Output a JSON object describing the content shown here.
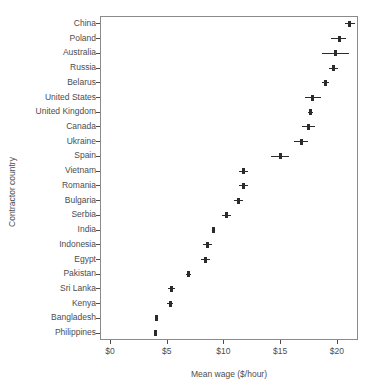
{
  "chart_data": {
    "type": "scatter",
    "title": "",
    "xlabel": "Mean wage ($/hour)",
    "ylabel": "Contractor country",
    "xlim": [
      -1.0,
      22.8
    ],
    "xticks": [
      0,
      5,
      10,
      15,
      20
    ],
    "xticklabels": [
      "$0",
      "$5",
      "$10",
      "$15",
      "$20"
    ],
    "grid": false,
    "legend": null,
    "orientation": "horizontal",
    "categories": [
      "China",
      "Poland",
      "Australia",
      "Russia",
      "Belarus",
      "United States",
      "United Kingdom",
      "Canada",
      "Ukraine",
      "Spain",
      "Vietnam",
      "Romania",
      "Bulgaria",
      "Serbia",
      "India",
      "Indonesia",
      "Egypt",
      "Pakistan",
      "Sri Lanka",
      "Kenya",
      "Bangladesh",
      "Philippines"
    ],
    "values": [
      21.1,
      20.2,
      19.9,
      19.7,
      19.0,
      17.9,
      17.7,
      17.5,
      16.9,
      15.0,
      11.8,
      11.8,
      11.3,
      10.3,
      9.1,
      8.6,
      8.4,
      6.9,
      5.4,
      5.3,
      4.1,
      4.0
    ],
    "error_low": [
      20.7,
      19.5,
      18.7,
      19.3,
      18.7,
      17.2,
      17.5,
      16.9,
      16.2,
      14.2,
      11.4,
      11.4,
      10.9,
      9.9,
      9.0,
      8.2,
      8.0,
      6.7,
      5.1,
      5.0,
      4.0,
      3.9
    ],
    "error_high": [
      21.6,
      20.8,
      21.1,
      20.1,
      19.3,
      18.6,
      17.9,
      18.1,
      17.5,
      15.8,
      12.2,
      12.2,
      11.7,
      10.7,
      9.2,
      9.0,
      8.8,
      7.1,
      5.7,
      5.6,
      4.2,
      4.1
    ],
    "marker": "plus",
    "marker_color": "#2b2b2b",
    "panel_border_color": "#8a8a8a",
    "text_color": "#4d4d4d",
    "background": "#ffffff"
  }
}
